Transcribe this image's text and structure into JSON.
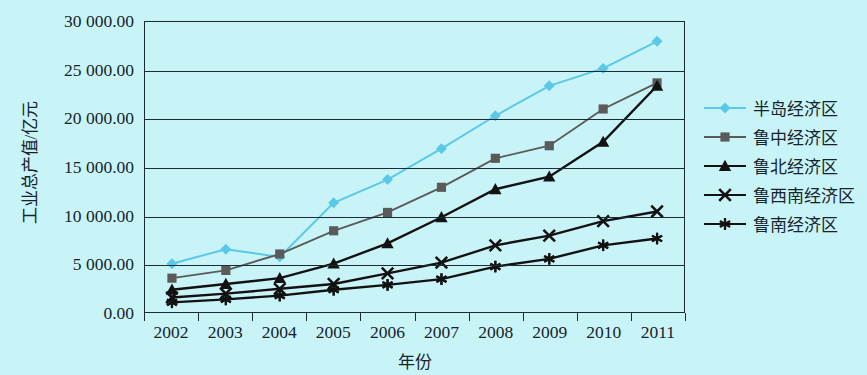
{
  "chart": {
    "type": "line",
    "xlabel": "年份",
    "ylabel": "工业总产值/亿元",
    "y_ticks": [
      "0.00",
      "5 000.00",
      "10 000.00",
      "15 000.00",
      "20 000.00",
      "25 000.00",
      "30 000.00"
    ],
    "y_tick_values": [
      0,
      5000,
      10000,
      15000,
      20000,
      25000,
      30000
    ],
    "x_ticks": [
      "2002",
      "2003",
      "2004",
      "2005",
      "2006",
      "2007",
      "2008",
      "2009",
      "2010",
      "2011"
    ],
    "background_color": "#c9f4f7",
    "axis_color": "#1b2a33",
    "grid": true,
    "legend_position": "right"
  },
  "chart_data": {
    "type": "line",
    "title": "",
    "xlabel": "年份",
    "ylabel": "工业总产值/亿元",
    "categories": [
      "2002",
      "2003",
      "2004",
      "2005",
      "2006",
      "2007",
      "2008",
      "2009",
      "2010",
      "2011"
    ],
    "ylim": [
      0,
      30000
    ],
    "yticks": [
      0,
      5000,
      10000,
      15000,
      20000,
      25000,
      30000
    ],
    "grid": true,
    "legend_position": "right",
    "series": [
      {
        "name": "半岛经济区",
        "color": "#5ac8e8",
        "marker": "diamond",
        "values": [
          5000,
          6500,
          5700,
          11300,
          13700,
          16900,
          20300,
          23400,
          25200,
          28000
        ]
      },
      {
        "name": "鲁中经济区",
        "color": "#5a5a5a",
        "marker": "square",
        "values": [
          3500,
          4300,
          6000,
          8400,
          10300,
          12900,
          15900,
          17200,
          21000,
          23700
        ]
      },
      {
        "name": "鲁北经济区",
        "color": "#121212",
        "marker": "triangle",
        "values": [
          2300,
          2900,
          3500,
          5000,
          7100,
          9800,
          12700,
          14000,
          17600,
          23400
        ]
      },
      {
        "name": "鲁西南经济区",
        "color": "#121212",
        "marker": "x",
        "values": [
          1500,
          1900,
          2400,
          2900,
          4000,
          5100,
          6900,
          7900,
          9400,
          10400
        ]
      },
      {
        "name": "鲁南经济区",
        "color": "#121212",
        "marker": "star",
        "values": [
          1000,
          1300,
          1700,
          2300,
          2800,
          3400,
          4700,
          5500,
          6900,
          7600
        ]
      }
    ]
  }
}
